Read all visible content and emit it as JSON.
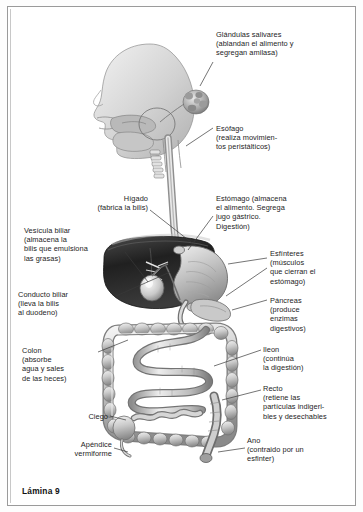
{
  "plate": {
    "caption": "Lámina 9",
    "subject": "Aparato digestivo humano",
    "language": "es"
  },
  "colors": {
    "ink": "#1d1d1d",
    "frame": "#9a9a9a",
    "leader": "#3a3a3a",
    "liver": "#2b2b2b",
    "organ_light": "#d8d8d8",
    "organ_mid": "#a9a9a9",
    "organ_dark": "#6e6e6e",
    "page": "#ffffff"
  },
  "labels": [
    {
      "id": "salivares",
      "name": "Glándulas salivares",
      "text": "Glándulas salivares\n(ablandan el alimento y\nsegregan amilasa)"
    },
    {
      "id": "esofago",
      "name": "Esófago",
      "text": "Esófago\n(realiza movimien-\ntos peristálticos)"
    },
    {
      "id": "estomago",
      "name": "Estómago",
      "text": "Estómago (almacena\nel alimento. Segrega\njugo gástrico.\nDigestión)"
    },
    {
      "id": "esfinteres",
      "name": "Esfínteres",
      "text": "Esfínteres\n(músculos\nque cierran el\nestómago)"
    },
    {
      "id": "pancreas",
      "name": "Páncreas",
      "text": "Páncreas\n(produce\nenzimas\ndigestivos)"
    },
    {
      "id": "ileon",
      "name": "Íleon",
      "text": "Ileon\n(continúa\nla digestión)"
    },
    {
      "id": "recto",
      "name": "Recto",
      "text": "Recto\n(retiene las\npartículas indigeri-\nbles y desechables"
    },
    {
      "id": "ano",
      "name": "Ano",
      "text": "Ano\n(contraido por un\nesfinter)"
    },
    {
      "id": "higado",
      "name": "Hígado",
      "text": "Hígado\n(fabrica la bilis)"
    },
    {
      "id": "vesicula",
      "name": "Vesícula biliar",
      "text": "Vesícula biliar\n(almacena la\nbilis que emulsiona\nlas grasas)"
    },
    {
      "id": "conducto",
      "name": "Conducto biliar",
      "text": "Conducto biliar\n(lleva la bilis\nal duodeno)"
    },
    {
      "id": "colon",
      "name": "Colon",
      "text": "Colon\n(absorbe\nagua y sales\nde las heces)"
    },
    {
      "id": "ciego",
      "name": "Ciego",
      "text": "Ciego"
    },
    {
      "id": "apendice",
      "name": "Apéndice vermiforme",
      "text": "Apéndice\nvermiforme"
    }
  ]
}
